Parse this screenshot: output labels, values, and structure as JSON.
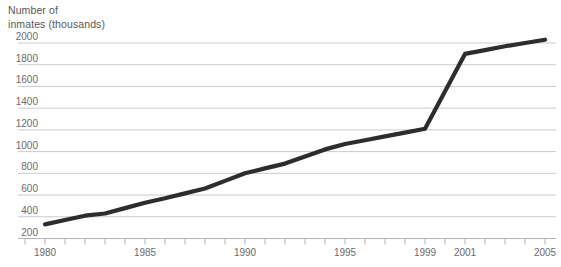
{
  "chart_data": {
    "type": "line",
    "title_lines": [
      "Number of",
      "inmates (thousands)"
    ],
    "xlabel": "",
    "ylabel": "Number of inmates (thousands)",
    "xlim": [
      1979,
      2005
    ],
    "ylim": [
      200,
      2000
    ],
    "grid": true,
    "legend": "none",
    "y_ticks": [
      200,
      400,
      600,
      800,
      1000,
      1200,
      1400,
      1600,
      1800,
      2000
    ],
    "x_tick_years": [
      1979,
      1980,
      1981,
      1982,
      1983,
      1984,
      1985,
      1986,
      1987,
      1988,
      1989,
      1990,
      1991,
      1992,
      1993,
      1994,
      1995,
      1996,
      1997,
      1998,
      1999,
      2000,
      2001,
      2002,
      2003,
      2004,
      2005
    ],
    "x_label_years": [
      1980,
      1985,
      1990,
      1995,
      1999,
      2001,
      2005
    ],
    "series": [
      {
        "name": "inmates",
        "points": [
          [
            1980,
            330
          ],
          [
            1981,
            370
          ],
          [
            1982,
            410
          ],
          [
            1983,
            430
          ],
          [
            1984,
            480
          ],
          [
            1985,
            530
          ],
          [
            1986,
            570
          ],
          [
            1987,
            615
          ],
          [
            1988,
            660
          ],
          [
            1989,
            730
          ],
          [
            1990,
            800
          ],
          [
            1991,
            845
          ],
          [
            1992,
            890
          ],
          [
            1993,
            955
          ],
          [
            1994,
            1020
          ],
          [
            1995,
            1070
          ],
          [
            1996,
            1105
          ],
          [
            1997,
            1140
          ],
          [
            1998,
            1175
          ],
          [
            1999,
            1210
          ],
          [
            2001,
            1900
          ],
          [
            2002,
            1935
          ],
          [
            2003,
            1970
          ],
          [
            2004,
            2000
          ],
          [
            2005,
            2030
          ]
        ]
      }
    ],
    "colors": {
      "line": "#2d2d2d",
      "grid": "#cbcbcb",
      "axis": "#b3b3b3",
      "tick": "#b3b3b3",
      "label": "#6b6b6b",
      "title": "#575757",
      "background": "#ffffff"
    }
  }
}
